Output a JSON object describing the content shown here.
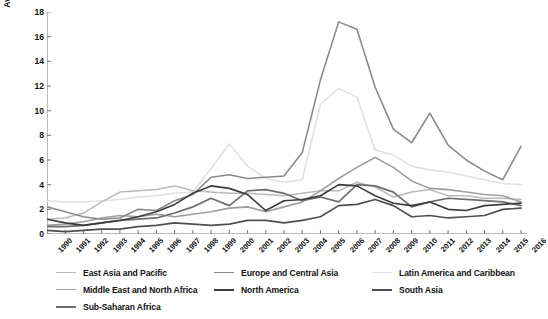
{
  "chart_data": {
    "type": "line",
    "title": "",
    "xlabel": "",
    "ylabel": "Average share of GDP from FDI net inflows (%)",
    "ylim": [
      0,
      18
    ],
    "yticks": [
      0,
      2,
      4,
      6,
      8,
      10,
      12,
      14,
      16,
      18
    ],
    "grid": false,
    "legend_position": "bottom",
    "x": [
      1990,
      1991,
      1992,
      1993,
      1994,
      1995,
      1996,
      1997,
      1998,
      1999,
      2000,
      2001,
      2002,
      2003,
      2004,
      2005,
      2006,
      2007,
      2008,
      2009,
      2010,
      2011,
      2012,
      2013,
      2014,
      2015,
      2016
    ],
    "categories": [
      "1990",
      "1991",
      "1992",
      "1993",
      "1994",
      "1995",
      "1996",
      "1997",
      "1998",
      "1999",
      "2000",
      "2001",
      "2002",
      "2003",
      "2004",
      "2005",
      "2006",
      "2007",
      "2008",
      "2009",
      "2010",
      "2011",
      "2012",
      "2013",
      "2014",
      "2015",
      "2016"
    ],
    "series": [
      {
        "name": "East Asia and Pacific",
        "color": "#b9b9b9",
        "width": 1.5,
        "values": [
          1.2,
          1.3,
          1.7,
          2.6,
          3.4,
          3.5,
          3.6,
          3.9,
          3.5,
          3.4,
          3.3,
          3.3,
          3.2,
          3.1,
          3.3,
          3.5,
          3.5,
          4.2,
          3.8,
          3.0,
          3.4,
          3.6,
          3.1,
          3.1,
          2.9,
          2.9,
          2.8
        ]
      },
      {
        "name": "Europe and Central Asia",
        "color": "#8a8a8a",
        "width": 1.6,
        "values": [
          2.2,
          1.8,
          1.4,
          1.2,
          1.3,
          2.0,
          1.9,
          2.7,
          3.2,
          4.6,
          4.8,
          4.5,
          4.6,
          4.7,
          6.6,
          12.5,
          17.2,
          16.6,
          11.9,
          8.5,
          7.4,
          9.8,
          7.2,
          6.0,
          5.1,
          4.4,
          7.1
        ]
      },
      {
        "name": "Latin America and Caribbean",
        "color": "#e0e0e0",
        "width": 1.6,
        "values": [
          2.7,
          2.6,
          2.6,
          2.7,
          2.8,
          3.0,
          3.1,
          3.3,
          3.4,
          5.3,
          7.3,
          5.5,
          4.5,
          4.2,
          4.4,
          10.5,
          11.8,
          11.1,
          6.8,
          6.4,
          5.5,
          5.2,
          5.0,
          4.7,
          4.4,
          4.1,
          4.0
        ]
      },
      {
        "name": "Middle East and North Africa",
        "color": "#9e9e9e",
        "width": 1.6,
        "values": [
          0.7,
          0.8,
          1.0,
          1.3,
          1.5,
          1.4,
          1.6,
          1.4,
          1.6,
          1.8,
          2.1,
          2.2,
          1.8,
          2.2,
          2.6,
          3.5,
          4.5,
          5.4,
          6.2,
          5.4,
          4.3,
          3.7,
          3.6,
          3.4,
          3.2,
          3.1,
          2.6
        ]
      },
      {
        "name": "North America",
        "color": "#3c3c3c",
        "width": 1.6,
        "values": [
          1.2,
          0.9,
          0.7,
          0.9,
          1.1,
          1.4,
          1.8,
          2.4,
          3.3,
          3.9,
          3.7,
          3.2,
          1.9,
          2.7,
          2.8,
          3.1,
          4.0,
          3.9,
          3.1,
          2.5,
          2.3,
          2.6,
          2.0,
          1.9,
          2.3,
          2.4,
          2.5
        ]
      },
      {
        "name": "South Asia",
        "color": "#4f4f4f",
        "width": 1.7,
        "values": [
          0.3,
          0.2,
          0.3,
          0.4,
          0.4,
          0.6,
          0.7,
          0.9,
          0.8,
          0.7,
          0.8,
          1.1,
          1.1,
          0.9,
          1.1,
          1.4,
          2.3,
          2.4,
          2.8,
          2.3,
          1.4,
          1.5,
          1.3,
          1.4,
          1.5,
          2.0,
          2.1
        ]
      },
      {
        "name": "Sub-Saharan Africa",
        "color": "#6e6e6e",
        "width": 1.7,
        "values": [
          0.6,
          0.6,
          0.7,
          0.9,
          1.1,
          1.2,
          1.3,
          1.7,
          2.2,
          2.9,
          2.3,
          3.5,
          3.6,
          3.3,
          2.7,
          3.0,
          2.6,
          4.0,
          3.9,
          3.4,
          2.2,
          2.6,
          2.9,
          2.8,
          2.7,
          2.6,
          2.3
        ]
      }
    ]
  },
  "axes": {
    "y_tick_labels": [
      "0",
      "2",
      "4",
      "6",
      "8",
      "10",
      "12",
      "14",
      "16",
      "18"
    ],
    "x_tick_labels": [
      "1990",
      "1991",
      "1992",
      "1993",
      "1994",
      "1995",
      "1996",
      "1997",
      "1998",
      "1999",
      "2000",
      "2001",
      "2002",
      "2003",
      "2004",
      "2005",
      "2006",
      "2007",
      "2008",
      "2009",
      "2010",
      "2011",
      "2012",
      "2013",
      "2014",
      "2015",
      "2016"
    ],
    "y_axis_title": "Average share of GDP from FDI net inflows (%)"
  },
  "legend": {
    "entries": [
      {
        "label": "East Asia and Pacific",
        "color": "#b9b9b9",
        "width": 1.5
      },
      {
        "label": "Europe and Central Asia",
        "color": "#8a8a8a",
        "width": 1.6
      },
      {
        "label": "Latin America and Caribbean",
        "color": "#e0e0e0",
        "width": 1.6
      },
      {
        "label": "Middle East and North Africa",
        "color": "#9e9e9e",
        "width": 1.6
      },
      {
        "label": "North America",
        "color": "#3c3c3c",
        "width": 2.0
      },
      {
        "label": "South Asia",
        "color": "#4f4f4f",
        "width": 2.0
      },
      {
        "label": "Sub-Saharan Africa",
        "color": "#6e6e6e",
        "width": 2.0
      }
    ]
  },
  "style": {
    "axis_color": "#808080",
    "background": "#ffffff"
  }
}
